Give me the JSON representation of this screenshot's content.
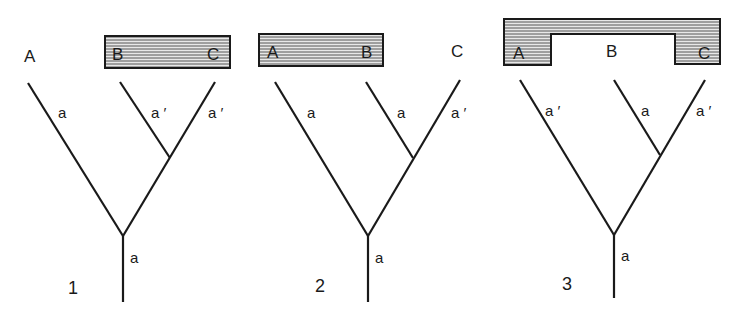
{
  "figure": {
    "trees": [
      {
        "number": "1",
        "taxa": [
          "A",
          "B",
          "C"
        ],
        "grouped_taxa": [
          "B",
          "C"
        ],
        "grouping": "B+C",
        "branch_labels": {
          "A": "a",
          "B": "a ′",
          "C": "a ′",
          "root": "a"
        }
      },
      {
        "number": "2",
        "taxa": [
          "A",
          "B",
          "C"
        ],
        "grouped_taxa": [
          "A",
          "B"
        ],
        "grouping": "A+B",
        "branch_labels": {
          "A": "a",
          "B": "a",
          "C": "a ′",
          "root": "a"
        }
      },
      {
        "number": "3",
        "taxa": [
          "A",
          "B",
          "C"
        ],
        "grouped_taxa": [
          "A",
          "C"
        ],
        "grouping": "A+C",
        "branch_labels": {
          "A": "a ′",
          "B": "a",
          "C": "a ′",
          "root": "a"
        }
      }
    ],
    "colors": {
      "ink": "#1a1a1a",
      "background": "#ffffff",
      "hatch": "#555555"
    }
  }
}
